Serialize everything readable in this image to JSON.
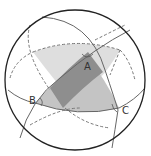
{
  "diagram": {
    "type": "spherical-triangle-on-sphere",
    "labels": {
      "A": "A",
      "B": "B",
      "C": "C"
    },
    "colors": {
      "sphere_outline": "#222222",
      "great_circle": "#666666",
      "hidden_arc": "#777777",
      "light_region": "#dedede",
      "medium_region": "#bdbdbd",
      "dark_region": "#8a8a8a",
      "background": "#ffffff"
    }
  }
}
